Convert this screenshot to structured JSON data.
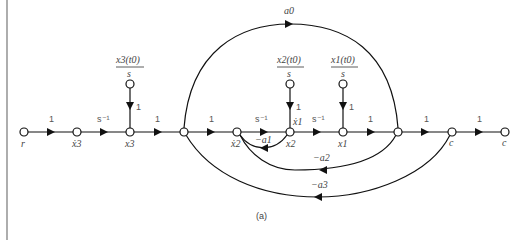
{
  "figure": {
    "caption": "(a)",
    "nodes": [
      {
        "id": "r",
        "label": "r"
      },
      {
        "id": "x3dot",
        "label": "ẋ3"
      },
      {
        "id": "x3",
        "label": "x3"
      },
      {
        "id": "n4",
        "label": ""
      },
      {
        "id": "x2dot",
        "label": "ẋ2"
      },
      {
        "id": "x2",
        "label": "x2"
      },
      {
        "id": "x1",
        "label": "x1"
      },
      {
        "id": "n8",
        "label": ""
      },
      {
        "id": "c1",
        "label": "c"
      },
      {
        "id": "c2",
        "label": "c"
      }
    ],
    "forward_gains": [
      "1",
      "s⁻¹",
      "1",
      "1",
      "s⁻¹",
      "s⁻¹",
      "1",
      "1",
      "1"
    ],
    "initial_conditions": [
      {
        "num": "x3(t0)",
        "den": "s",
        "gain": "1"
      },
      {
        "num": "x2(t0)",
        "den": "s",
        "gain": "1"
      },
      {
        "num": "x1(t0)",
        "den": "s",
        "gain": "1"
      }
    ],
    "x1dot_label": "ẋ1",
    "feedforward": {
      "gain": "a0"
    },
    "feedback": [
      {
        "gain": "−a1"
      },
      {
        "gain": "−a2"
      },
      {
        "gain": "−a3"
      }
    ]
  }
}
